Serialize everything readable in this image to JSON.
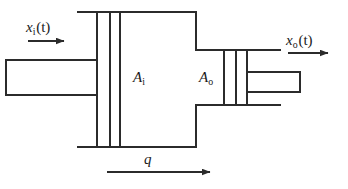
{
  "figure": {
    "type": "engineering-schematic",
    "background_color": "#ffffff",
    "line_color": "#2b2b2b"
  },
  "labels": {
    "input_displacement": {
      "symbol": "x",
      "subscript": "i",
      "argument": "(t)",
      "full": "xi (t)"
    },
    "output_displacement": {
      "symbol": "x",
      "subscript": "o",
      "argument": "(t)",
      "full": "xo (t)"
    },
    "input_area": {
      "symbol": "A",
      "subscript": "i",
      "full": "Ai"
    },
    "output_area": {
      "symbol": "A",
      "subscript": "o",
      "full": "Ao"
    },
    "flow_rate": {
      "symbol": "q",
      "full": "q"
    }
  },
  "arrows": {
    "input_arrow": {
      "direction": "right",
      "x1": 28,
      "y1": 41,
      "x2": 66,
      "y2": 41
    },
    "output_arrow": {
      "direction": "right",
      "x1": 288,
      "y1": 53,
      "x2": 330,
      "y2": 53
    },
    "flow_arrow": {
      "direction": "right",
      "x1": 107,
      "y1": 172,
      "x2": 212,
      "y2": 172
    }
  },
  "geometry": {
    "main_chamber": {
      "left": 78,
      "top": 12,
      "right": 196,
      "bottom": 147
    },
    "input_piston": {
      "left": 97,
      "top": 12,
      "right": 110,
      "bottom": 147
    },
    "input_piston_face": {
      "x": 120,
      "top": 12,
      "bottom": 147
    },
    "input_rod": {
      "left": 6,
      "top": 60,
      "right": 97,
      "bottom": 95
    },
    "output_neck_top": {
      "y": 50,
      "left": 196,
      "right": 280
    },
    "output_neck_bottom": {
      "y": 105,
      "left": 196,
      "right": 280
    },
    "output_piston": {
      "left": 224,
      "top": 50,
      "right": 236,
      "bottom": 105
    },
    "output_piston_face": {
      "x": 247,
      "top": 50,
      "bottom": 105
    },
    "output_rod": {
      "left": 247,
      "top": 72,
      "right": 300,
      "bottom": 92
    }
  }
}
